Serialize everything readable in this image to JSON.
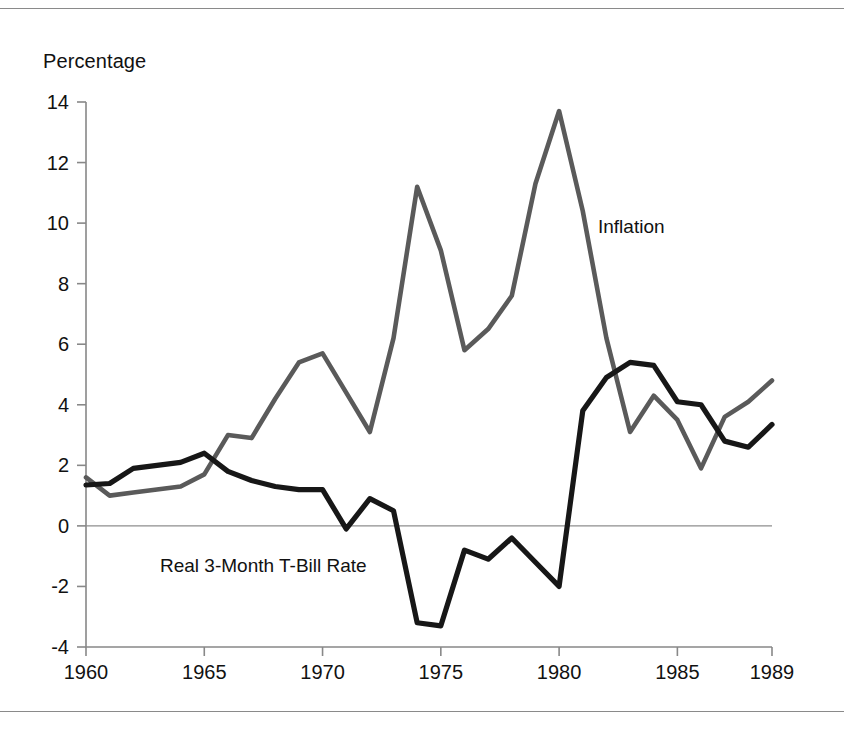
{
  "chart_data": {
    "type": "line",
    "title": "",
    "ylabel": "Percentage",
    "xlabel": "",
    "ylim": [
      -4,
      14
    ],
    "xlim": [
      1960,
      1989
    ],
    "yticks": [
      -4,
      -2,
      0,
      2,
      4,
      6,
      8,
      10,
      12,
      14
    ],
    "xticks": [
      1960,
      1965,
      1970,
      1975,
      1980,
      1985,
      1989
    ],
    "ytick_labels": [
      "-4",
      "-2",
      "0",
      "2",
      "4",
      "6",
      "8",
      "10",
      "12",
      "14"
    ],
    "xtick_labels": [
      "1960",
      "1965",
      "1970",
      "1975",
      "1980",
      "1985",
      "1989"
    ],
    "grid": false,
    "zero_line": true,
    "legend_position": "inline-annotations",
    "x": [
      1960,
      1961,
      1962,
      1963,
      1964,
      1965,
      1966,
      1967,
      1968,
      1969,
      1970,
      1971,
      1972,
      1973,
      1974,
      1975,
      1976,
      1977,
      1978,
      1979,
      1980,
      1981,
      1982,
      1983,
      1984,
      1985,
      1986,
      1987,
      1988,
      1989
    ],
    "series": [
      {
        "name": "Inflation",
        "color": "#5a5a5a",
        "values": [
          1.6,
          1.0,
          1.1,
          1.2,
          1.3,
          1.7,
          3.0,
          2.9,
          4.2,
          5.4,
          5.7,
          4.4,
          3.1,
          6.2,
          11.2,
          9.1,
          5.8,
          6.5,
          7.6,
          11.3,
          13.7,
          10.4,
          6.2,
          3.1,
          4.3,
          3.5,
          1.9,
          3.6,
          4.1,
          4.8
        ]
      },
      {
        "name": "Real 3-Month T-Bill Rate",
        "color": "#171717",
        "values": [
          1.35,
          1.4,
          1.9,
          2.0,
          2.1,
          2.4,
          1.8,
          1.5,
          1.3,
          1.2,
          1.2,
          -0.1,
          0.9,
          0.5,
          -3.2,
          -3.3,
          -0.8,
          -1.1,
          -0.4,
          -1.2,
          -2.0,
          3.8,
          4.9,
          5.4,
          5.3,
          4.1,
          4.0,
          2.8,
          2.6,
          3.35
        ]
      }
    ],
    "annotations": [
      {
        "text": "Inflation",
        "x": 1981.5,
        "y": 9.3
      },
      {
        "text": "Real 3-Month T-Bill Rate",
        "x": 1963.5,
        "y": -1.6
      }
    ]
  }
}
